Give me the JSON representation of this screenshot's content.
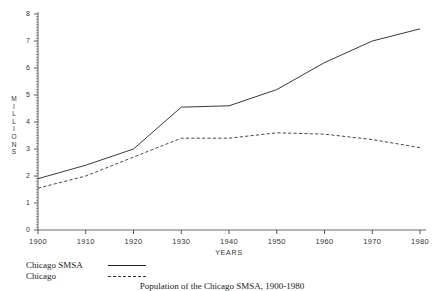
{
  "chart_data": {
    "type": "line",
    "title": "",
    "xlabel": "YEARS",
    "ylabel": "MILLIONS",
    "x": [
      1900,
      1910,
      1920,
      1930,
      1940,
      1950,
      1960,
      1970,
      1980
    ],
    "xticklabels": [
      "1900",
      "1910",
      "1920",
      "1930",
      "1940",
      "1950",
      "1960",
      "1970",
      "1980"
    ],
    "yticklabels": [
      "0",
      "1",
      "2",
      "3",
      "4",
      "5",
      "6",
      "7",
      "8"
    ],
    "xlim": [
      1900,
      1980
    ],
    "ylim": [
      0,
      8
    ],
    "grid": false,
    "legend_position": "below-left",
    "series": [
      {
        "name": "Chicago SMSA",
        "style": "solid",
        "color": "#222222",
        "values": [
          1.9,
          2.4,
          3.0,
          4.55,
          4.6,
          5.2,
          6.2,
          7.0,
          7.45
        ]
      },
      {
        "name": "Chicago",
        "style": "dashed",
        "color": "#333333",
        "values": [
          1.55,
          2.0,
          2.7,
          3.4,
          3.4,
          3.6,
          3.55,
          3.35,
          3.05
        ]
      }
    ]
  },
  "axis": {
    "y_title_letters": [
      "M",
      "I",
      "L",
      "L",
      "I",
      "O",
      "N",
      "S"
    ],
    "x_title": "YEARS"
  },
  "legend": {
    "rows": [
      {
        "label": "Chicago SMSA",
        "style": "solid"
      },
      {
        "label": "Chicago",
        "style": "dashed"
      }
    ]
  },
  "caption": {
    "text": "Population of the Chicago SMSA, 1900-1980"
  }
}
